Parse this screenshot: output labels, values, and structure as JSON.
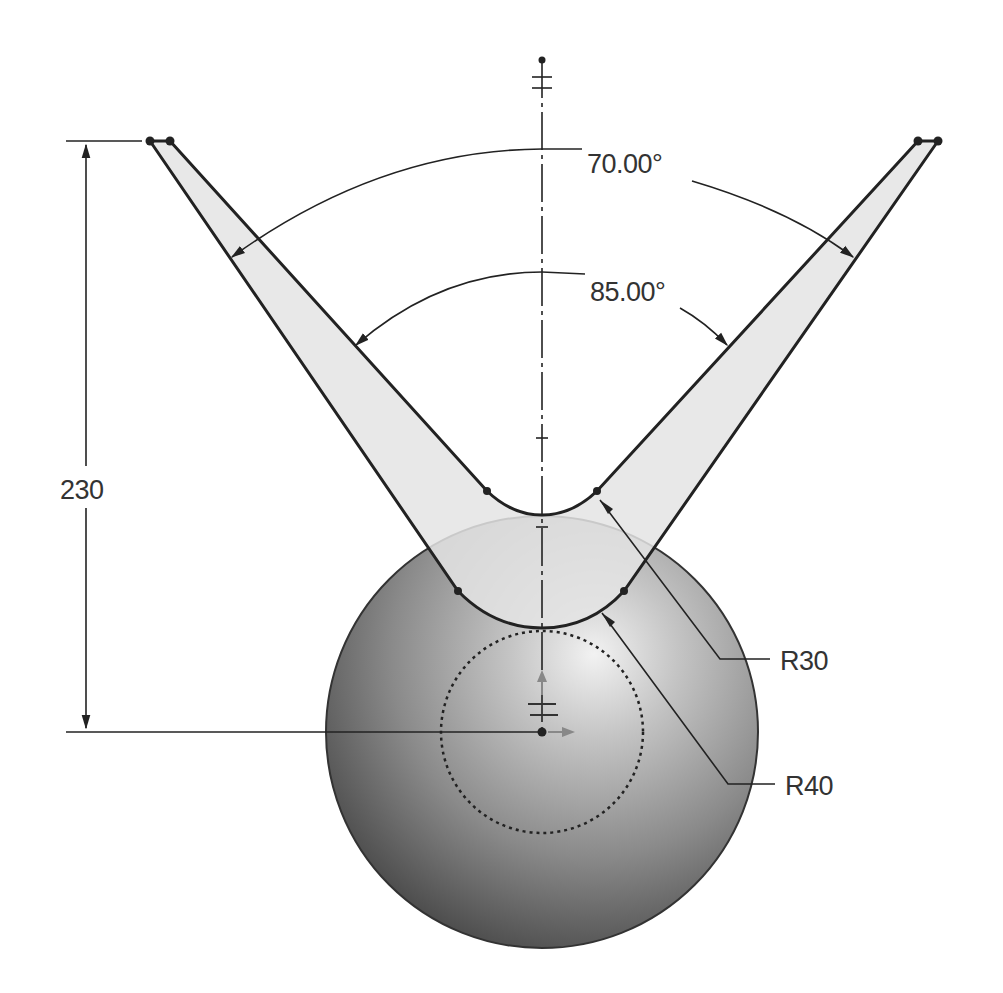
{
  "drawing": {
    "type": "CAD sketch - V-block with sphere",
    "colors": {
      "background": "#ffffff",
      "line": "#222222",
      "arm_fill": "#e6e6e6",
      "sphere_light": "#e8e8e8",
      "sphere_dark": "#3c3c3c",
      "dim_text": "#333333"
    },
    "dimensions": {
      "outer_angle": "70.00°",
      "inner_angle": "85.00°",
      "height": "230",
      "fillet_small": "R30",
      "fillet_large": "R40"
    }
  }
}
